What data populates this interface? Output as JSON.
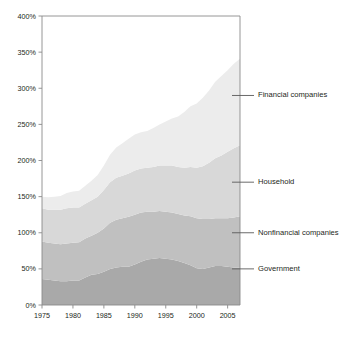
{
  "chart_data": {
    "type": "area",
    "stacked": true,
    "title": "",
    "subtitle": "",
    "xlabel": "",
    "ylabel": "",
    "xlim": [
      1975,
      2007
    ],
    "ylim": [
      0,
      400
    ],
    "grid": false,
    "legend_position": "right-inline-leader-lines",
    "y_tick_labels": [
      "0%",
      "50%",
      "100%",
      "150%",
      "200%",
      "250%",
      "300%",
      "350%",
      "400%"
    ],
    "y_tick_values": [
      0,
      50,
      100,
      150,
      200,
      250,
      300,
      350,
      400
    ],
    "x_tick_labels": [
      "1975",
      "1980",
      "1985",
      "1990",
      "1995",
      "2000",
      "2005"
    ],
    "x_tick_values": [
      1975,
      1980,
      1985,
      1990,
      1995,
      2000,
      2005
    ],
    "x": [
      1975,
      1976,
      1977,
      1978,
      1979,
      1980,
      1981,
      1982,
      1983,
      1984,
      1985,
      1986,
      1987,
      1988,
      1989,
      1990,
      1991,
      1992,
      1993,
      1994,
      1995,
      1996,
      1997,
      1998,
      1999,
      2000,
      2001,
      2002,
      2003,
      2004,
      2005,
      2006,
      2007
    ],
    "series": [
      {
        "name": "Government",
        "color": "#a9a9a9",
        "label_value_percent": 50,
        "values": [
          36,
          35,
          34,
          33,
          33,
          34,
          34,
          38,
          42,
          43,
          46,
          50,
          52,
          53,
          53,
          56,
          60,
          63,
          64,
          65,
          64,
          63,
          61,
          58,
          55,
          51,
          50,
          52,
          54,
          54,
          53,
          52,
          52
        ]
      },
      {
        "name": "Nonfinancial companies",
        "color": "#c0c0c0",
        "label_value_percent": 100,
        "values": [
          52,
          51,
          51,
          51,
          52,
          52,
          53,
          54,
          54,
          57,
          60,
          64,
          66,
          67,
          69,
          69,
          68,
          66,
          65,
          65,
          65,
          65,
          65,
          66,
          68,
          69,
          69,
          67,
          66,
          66,
          67,
          69,
          71
        ]
      },
      {
        "name": "Household",
        "color": "#d8d8d8",
        "label_value_percent": 170,
        "values": [
          46,
          46,
          47,
          48,
          49,
          49,
          48,
          48,
          49,
          50,
          53,
          56,
          58,
          59,
          60,
          61,
          61,
          61,
          62,
          63,
          64,
          65,
          65,
          66,
          68,
          70,
          73,
          78,
          83,
          87,
          92,
          96,
          98
        ]
      },
      {
        "name": "Financial companies",
        "color": "#ececec",
        "label_value_percent": 290,
        "values": [
          16,
          17,
          18,
          19,
          21,
          22,
          23,
          25,
          27,
          30,
          34,
          38,
          42,
          45,
          48,
          50,
          50,
          51,
          54,
          57,
          61,
          65,
          70,
          77,
          84,
          89,
          95,
          100,
          106,
          110,
          113,
          117,
          120
        ]
      }
    ],
    "totals": [
      150,
      149,
      150,
      151,
      155,
      157,
      158,
      165,
      172,
      180,
      193,
      208,
      218,
      224,
      230,
      236,
      239,
      241,
      245,
      250,
      254,
      258,
      261,
      267,
      275,
      279,
      287,
      297,
      309,
      317,
      325,
      334,
      341
    ],
    "annotations": []
  },
  "legend": {
    "items": [
      {
        "label": "Financial companies"
      },
      {
        "label": "Household"
      },
      {
        "label": "Nonfinancial companies"
      },
      {
        "label": "Government"
      }
    ]
  }
}
